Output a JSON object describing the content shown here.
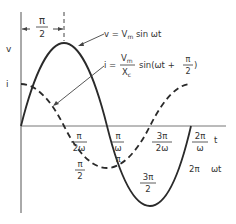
{
  "diagram": {
    "y_axis_labels": {
      "v": "v",
      "i": "i"
    },
    "x_axis_label_t": "t",
    "x_axis_label_wt": "ωt",
    "phase_marker": {
      "num": "π",
      "den": "2"
    },
    "equations": {
      "v": {
        "lhs": "v = V",
        "sub": "m",
        "rhs": " sin ωt"
      },
      "i": {
        "lhs": "i =",
        "num": "V",
        "num_sub": "m",
        "den": "X",
        "den_sub": "c",
        "rhs": "sin(ωt + ",
        "frac_num": "π",
        "frac_den": "2",
        "close": ")"
      }
    },
    "time_ticks": [
      {
        "num": "π",
        "den": "2ω"
      },
      {
        "num": "π",
        "den": "ω"
      },
      {
        "num": "3π",
        "den": "2ω"
      },
      {
        "num": "2π",
        "den": "ω"
      }
    ],
    "angle_ticks": [
      {
        "num": "π",
        "den": "2"
      },
      {
        "text": "π"
      },
      {
        "num": "3π",
        "den": "2"
      },
      {
        "text": "2π"
      }
    ],
    "colors": {
      "line": "#2a2a2a",
      "text": "#333333"
    }
  }
}
